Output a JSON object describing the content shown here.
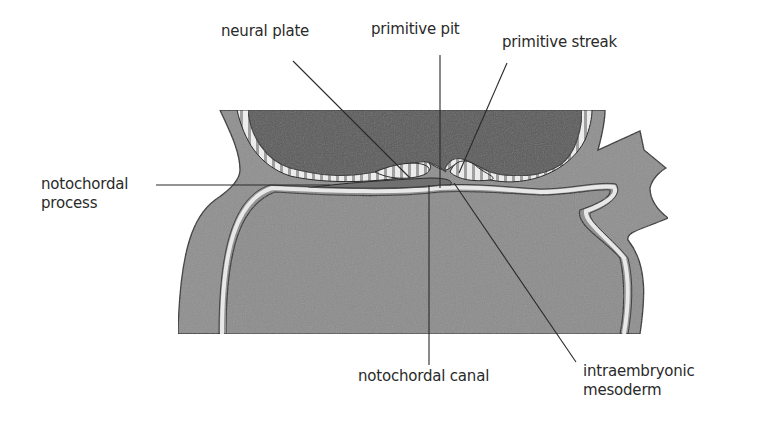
{
  "diagram": {
    "type": "embryo-cross-section",
    "colors": {
      "background": "#ffffff",
      "mesoderm_gray": "#8f8f8f",
      "amniotic_dark": "#5a5a5a",
      "yolk_sac_gray": "#8c8c8c",
      "stripe_light": "#ececec",
      "stripe_dark": "#9a9a9a",
      "outline": "#2c2c2c",
      "pale_line": "#e8e8e8",
      "label_text": "#2a2a2a"
    },
    "labels": [
      {
        "id": "neural-plate",
        "lines": [
          "neural plate"
        ],
        "x": 221,
        "y": 22
      },
      {
        "id": "primitive-pit",
        "lines": [
          "primitive pit"
        ],
        "x": 371,
        "y": 20
      },
      {
        "id": "primitive-streak",
        "lines": [
          "primitive streak"
        ],
        "x": 502,
        "y": 33
      },
      {
        "id": "notochordal-process",
        "lines": [
          "notochordal",
          "process"
        ],
        "x": 41,
        "y": 175
      },
      {
        "id": "notochordal-canal",
        "lines": [
          "notochordal canal"
        ],
        "x": 358,
        "y": 367
      },
      {
        "id": "intraembryonic-mesoderm",
        "lines": [
          "intraembryonic",
          "mesoderm"
        ],
        "x": 583,
        "y": 362
      }
    ],
    "leader_lines": [
      {
        "for": "neural-plate",
        "x1": 293,
        "y1": 61,
        "x2": 410,
        "y2": 178
      },
      {
        "for": "primitive-pit",
        "x1": 440,
        "y1": 55,
        "x2": 440,
        "y2": 188
      },
      {
        "for": "primitive-streak",
        "x1": 507,
        "y1": 63,
        "x2": 459,
        "y2": 173
      },
      {
        "for": "notochordal-process",
        "x1": 156,
        "y1": 185,
        "x2": 330,
        "y2": 185
      },
      {
        "for": "notochordal-canal",
        "x1": 429,
        "y1": 185,
        "x2": 429,
        "y2": 365
      },
      {
        "for": "intraembryonic-mesoderm",
        "x1": 454,
        "y1": 183,
        "x2": 576,
        "y2": 362
      }
    ]
  }
}
